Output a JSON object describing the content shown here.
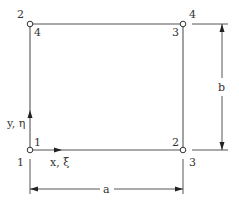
{
  "diagram": {
    "type": "rectangular finite element with node numbering",
    "nodes": [
      {
        "id": "bottom-left",
        "global_label": "1",
        "local_label": "1"
      },
      {
        "id": "bottom-right",
        "global_label": "3",
        "local_label": "2"
      },
      {
        "id": "top-right",
        "global_label": "4",
        "local_label": "3"
      },
      {
        "id": "top-left",
        "global_label": "2",
        "local_label": "4"
      }
    ],
    "axes": {
      "x_label": "x, ξ",
      "y_label": "y, η"
    },
    "dimensions": {
      "width_label": "a",
      "height_label": "b"
    },
    "colors": {
      "line": "#555555",
      "text": "#333333",
      "background": "#ffffff"
    }
  }
}
